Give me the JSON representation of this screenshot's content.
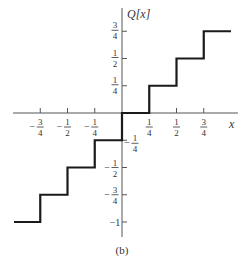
{
  "chart_data": {
    "type": "line",
    "subtype": "step",
    "title": "",
    "xlabel": "x",
    "ylabel": "Q[x]",
    "caption": "(b)",
    "xlim": [
      -1.0,
      1.0
    ],
    "ylim": [
      -1.0,
      0.75
    ],
    "grid": false,
    "legend": null,
    "x_ticks": [
      {
        "value": -0.75,
        "sign": "−",
        "num": "3",
        "den": "4"
      },
      {
        "value": -0.5,
        "sign": "−",
        "num": "1",
        "den": "2"
      },
      {
        "value": -0.25,
        "sign": "−",
        "num": "1",
        "den": "4"
      },
      {
        "value": 0.25,
        "sign": "",
        "num": "1",
        "den": "4"
      },
      {
        "value": 0.5,
        "sign": "",
        "num": "1",
        "den": "2"
      },
      {
        "value": 0.75,
        "sign": "",
        "num": "3",
        "den": "4"
      }
    ],
    "y_ticks": [
      {
        "value": 0.75,
        "sign": "",
        "num": "3",
        "den": "4"
      },
      {
        "value": 0.5,
        "sign": "",
        "num": "1",
        "den": "2"
      },
      {
        "value": 0.25,
        "sign": "",
        "num": "1",
        "den": "4"
      },
      {
        "value": -0.25,
        "sign": "−",
        "num": "1",
        "den": "4"
      },
      {
        "value": -0.5,
        "sign": "−",
        "num": "1",
        "den": "2"
      },
      {
        "value": -0.75,
        "sign": "−",
        "num": "3",
        "den": "4"
      },
      {
        "value": -1,
        "sign": "",
        "text": "−1"
      }
    ],
    "series": [
      {
        "name": "Q[x]",
        "description": "Quantizer staircase: Q[x] = floor(4x)/4 style steps of width 1/4",
        "steps": [
          {
            "x_start": -1.0,
            "x_end": -0.75,
            "y": -1.0
          },
          {
            "x_start": -0.75,
            "x_end": -0.5,
            "y": -0.75
          },
          {
            "x_start": -0.5,
            "x_end": -0.25,
            "y": -0.5
          },
          {
            "x_start": -0.25,
            "x_end": 0.0,
            "y": -0.25
          },
          {
            "x_start": 0.0,
            "x_end": 0.25,
            "y": 0.0
          },
          {
            "x_start": 0.25,
            "x_end": 0.5,
            "y": 0.25
          },
          {
            "x_start": 0.5,
            "x_end": 0.75,
            "y": 0.5
          },
          {
            "x_start": 0.75,
            "x_end": 1.0,
            "y": 0.75
          }
        ]
      }
    ]
  },
  "colors": {
    "axis": "#555555",
    "step_line": "#1a1a1a",
    "text": "#333333",
    "background": "#ffffff"
  }
}
